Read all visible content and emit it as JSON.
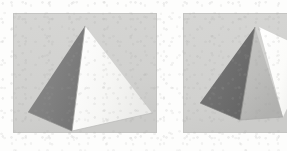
{
  "figure": {
    "kind": "image-pair",
    "sheet_background": "#fdfdfc",
    "panel_count": 2,
    "panels": [
      {
        "id": "left",
        "name": "pyramid-view-a",
        "caption": "",
        "background_color": "#d2d2d0",
        "border_color": "#c4c4c2",
        "rect": {
          "x": 13,
          "y": 13,
          "width": 144,
          "height": 120
        },
        "object": {
          "type": "pyramid",
          "base": "square",
          "visible_faces": 2,
          "apex": {
            "x": 72,
            "y": 13
          },
          "vertices": {
            "apex": {
              "x": 72,
              "y": 13
            },
            "left": {
              "x": 15,
              "y": 99
            },
            "front": {
              "x": 59,
              "y": 118
            },
            "right": {
              "x": 139,
              "y": 100
            }
          },
          "faces": [
            {
              "name": "left-face",
              "shade": "shadowed",
              "color": "#808080",
              "highlight_color": "#8c8c8c",
              "points": "72,13 15,99 59,118"
            },
            {
              "name": "right-face",
              "shade": "lit",
              "color": "#f5f5f3",
              "highlight_color": "#ffffff",
              "points": "72,13 59,118 139,100"
            }
          ],
          "edges": [
            {
              "name": "front-ridge",
              "from": "apex",
              "to": "front",
              "color": "#9a9a98"
            },
            {
              "name": "base-left",
              "from": "left",
              "to": "front",
              "color": "#8e8e8c"
            },
            {
              "name": "base-right",
              "from": "front",
              "to": "right",
              "color": "#b8b8b6"
            }
          ]
        }
      },
      {
        "id": "right",
        "name": "pyramid-view-b",
        "caption": "",
        "background_color": "#d2d2d0",
        "border_color": "#c4c4c2",
        "cropped_at_image_edge": true,
        "rect": {
          "x": 183,
          "y": 13,
          "width": 104,
          "height": 120
        },
        "object": {
          "type": "pyramid",
          "base": "square",
          "visible_faces": 3,
          "apex": {
            "x": 72,
            "y": 14
          },
          "vertices": {
            "apex": {
              "x": 72,
              "y": 14
            },
            "left": {
              "x": 17,
              "y": 90
            },
            "front": {
              "x": 57,
              "y": 107
            },
            "right": {
              "x": 112,
              "y": 97
            }
          },
          "faces": [
            {
              "name": "left-face",
              "shade": "shadowed",
              "color": "#6e6e6e",
              "highlight_color": "#7c7c7c",
              "points": "72,14 17,90 57,107"
            },
            {
              "name": "center-face",
              "shade": "mid",
              "color": "#bcbcba",
              "highlight_color": "#c8c8c6",
              "points": "72,14 57,107 100,104"
            },
            {
              "name": "right-face",
              "shade": "lit",
              "color": "#fbfbf9",
              "highlight_color": "#ffffff",
              "points": "76,14 100,104 116,72"
            }
          ],
          "edges": [
            {
              "name": "front-ridge",
              "from": "apex",
              "to": "front",
              "color": "#8e8e8c"
            },
            {
              "name": "right-ridge",
              "from": "apex",
              "to": "right",
              "color": "#cfcfcd"
            },
            {
              "name": "base-left",
              "from": "left",
              "to": "front",
              "color": "#7e7e7c"
            },
            {
              "name": "base-right",
              "from": "front",
              "to": "right",
              "color": "#a9a9a7"
            }
          ]
        }
      }
    ]
  }
}
